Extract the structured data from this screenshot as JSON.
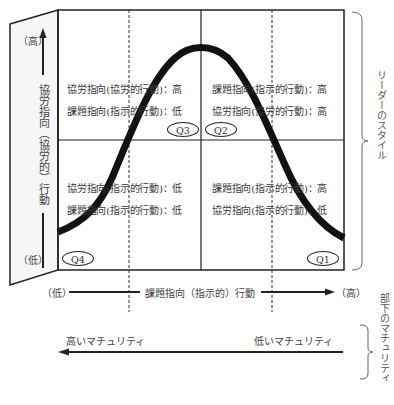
{
  "diagram": {
    "type": "situational-leadership-model",
    "left_axis": {
      "high": "（高）",
      "label": "協労指向（協労的）行動",
      "low": "（低）"
    },
    "bottom_axis": {
      "low": "（低）",
      "label": "課題指向（指示的）行動",
      "high": "（高）"
    },
    "right_brace_label": "リーダーのスタイル",
    "maturity": {
      "high": "高いマチュリティ",
      "low": "低いマチュリティ",
      "brace_label": "部下のマチュリティ"
    },
    "quadrants": [
      {
        "id": "Q3",
        "label": "Q3",
        "line1": "協労指向(協労的行動)：高",
        "line2": "課題指向(指示的行動)：低"
      },
      {
        "id": "Q2",
        "label": "Q2",
        "line1": "課題指向(指示的行動)：高",
        "line2": "協労指向(協労的行動)：高"
      },
      {
        "id": "Q4",
        "label": "Q4",
        "line1": "協労指向(指示的行動)：低",
        "line2": "課題指向(指示的行動)：低"
      },
      {
        "id": "Q1",
        "label": "Q1",
        "line1": "課題指向(指示的行動)：高",
        "line2": "協労指向(指示的行動)：低"
      }
    ],
    "colors": {
      "line": "#222222",
      "text": "#3a3a3a",
      "panel": "#f4f4f4"
    }
  }
}
